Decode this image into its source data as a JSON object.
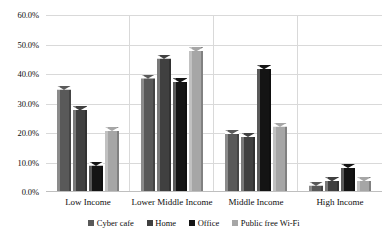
{
  "chart_data": {
    "type": "bar",
    "title": "",
    "subtitle": "",
    "xlabel": "",
    "ylabel": "",
    "categories": [
      "Low Income",
      "Lower Middle Income",
      "Middle Income",
      "High Income"
    ],
    "series": [
      {
        "name": "Cyber cafe",
        "color": "#595959",
        "values": [
          36.0,
          39.8,
          21.0,
          3.5
        ]
      },
      {
        "name": "Home",
        "color": "#404040",
        "values": [
          29.0,
          46.5,
          20.0,
          5.0
        ]
      },
      {
        "name": "Office",
        "color": "#141414",
        "values": [
          10.3,
          38.5,
          43.0,
          9.5
        ]
      },
      {
        "name": "Public free Wi-Fi",
        "color": "#a6a6a6",
        "values": [
          22.0,
          49.0,
          23.5,
          5.0
        ]
      }
    ],
    "ylim": [
      0,
      60
    ],
    "ytick_values": [
      0,
      10,
      20,
      30,
      40,
      50,
      60
    ],
    "ytick_labels": [
      "0.0%",
      "10.0%",
      "20.0%",
      "30.0%",
      "40.0%",
      "50.0%",
      "60.0%"
    ],
    "grid": true,
    "grid_axis": "y",
    "legend_position": "bottom",
    "gridline_color": "#d9d9d9",
    "axis_color": "#bfbfbf",
    "background_color": "#ffffff"
  }
}
